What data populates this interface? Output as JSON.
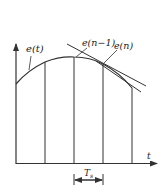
{
  "diagram": {
    "type": "sampled-signal-derivative-illustration",
    "labels": {
      "curve": "e(t)",
      "sample_prev": "e(n−1)",
      "sample_curr": "e(n)",
      "x_axis": "t",
      "period": "T",
      "period_sub": "s"
    },
    "colors": {
      "stroke": "#333333",
      "background": "#ffffff"
    },
    "samples": 5
  }
}
